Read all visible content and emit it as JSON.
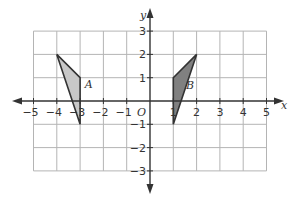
{
  "diagram": {
    "type": "coordinate-grid",
    "x_axis": {
      "label": "x",
      "min": -5,
      "max": 5,
      "ticks": [
        "-5",
        "-4",
        "-3",
        "-2",
        "-1",
        "1",
        "2",
        "3",
        "4",
        "5"
      ]
    },
    "y_axis": {
      "label": "y",
      "min": -3,
      "max": 3,
      "ticks": [
        "3",
        "2",
        "1",
        "-1",
        "-2",
        "-3"
      ]
    },
    "origin_label": "O",
    "shapes": [
      {
        "name": "A",
        "label": "A",
        "vertices": [
          [
            -4,
            2
          ],
          [
            -3,
            1
          ],
          [
            -3,
            -1
          ]
        ],
        "fill": "#c8c8c8"
      },
      {
        "name": "B",
        "label": "B",
        "vertices": [
          [
            1,
            1
          ],
          [
            2,
            2
          ],
          [
            1,
            -1
          ]
        ],
        "fill": "#808080"
      }
    ],
    "colors": {
      "grid": "#b4b4b4",
      "axis": "#333333",
      "outline": "#333333"
    }
  }
}
